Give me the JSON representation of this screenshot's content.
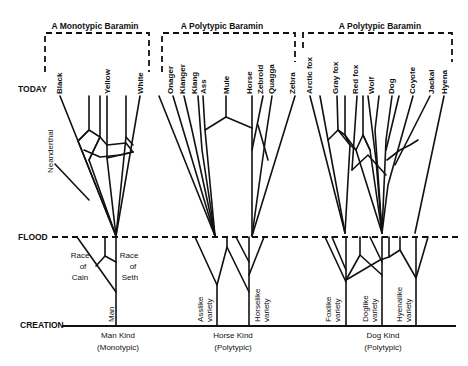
{
  "diagram": {
    "time_axis": {
      "today": "TODAY",
      "flood": "FLOOD",
      "creation": "CREATION"
    },
    "baramin_boxes": [
      {
        "label": "A Monotypic Baramin"
      },
      {
        "label": "A Polytypic Baramin"
      },
      {
        "label": "A Polytypic Baramin"
      }
    ],
    "groups": [
      {
        "kind": "Man Kind",
        "type": "(Monotypic)",
        "today_labels": [
          "Black",
          "Yellow",
          "White"
        ],
        "side_label": "Neanderthal",
        "pre_flood_labels": {
          "left": [
            "Race",
            "of",
            "Cain"
          ],
          "right": [
            "Race",
            "of",
            "Seth"
          ]
        },
        "root_label": "Man"
      },
      {
        "kind": "Horse Kind",
        "type": "(Polytypic)",
        "today_labels": [
          "Onager",
          "Kianger",
          "Kiang",
          "Ass",
          "Mule",
          "Horse",
          "Zebroid",
          "Quagga",
          "Zebra"
        ],
        "root_labels": [
          {
            "line1": "Asslike",
            "line2": "variety"
          },
          {
            "line1": "Horselike",
            "line2": "variety"
          }
        ]
      },
      {
        "kind": "Dog Kind",
        "type": "(Polytypic)",
        "today_labels": [
          "Arctic fox",
          "Gray fox",
          "Red fox",
          "Wolf",
          "Dog",
          "Coyote",
          "Jackal",
          "Hyena"
        ],
        "root_labels": [
          {
            "line1": "Foxlike",
            "line2": "variety"
          },
          {
            "line1": "Doglike",
            "line2": "variety"
          },
          {
            "line1": "Hyenalike",
            "line2": "variety"
          }
        ]
      }
    ]
  }
}
